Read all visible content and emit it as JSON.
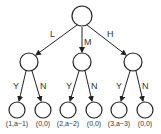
{
  "tree": {
    "root": {
      "id": "root"
    },
    "level1": [
      {
        "edge_label": "L",
        "x": 29
      },
      {
        "edge_label": "M",
        "x": 82
      },
      {
        "edge_label": "H",
        "x": 133
      }
    ],
    "leaves": [
      {
        "edge_label": "Y",
        "payoff": "(1,a−1)",
        "x": 17
      },
      {
        "edge_label": "N",
        "payoff": "(0,0)",
        "x": 43
      },
      {
        "edge_label": "Y",
        "payoff": "(2,a−2)",
        "x": 68
      },
      {
        "edge_label": "N",
        "payoff": "(0,0)",
        "x": 94
      },
      {
        "edge_label": "Y",
        "payoff": "(3,a−3)",
        "x": 119
      },
      {
        "edge_label": "N",
        "payoff": "(0,0)",
        "x": 145
      }
    ]
  }
}
